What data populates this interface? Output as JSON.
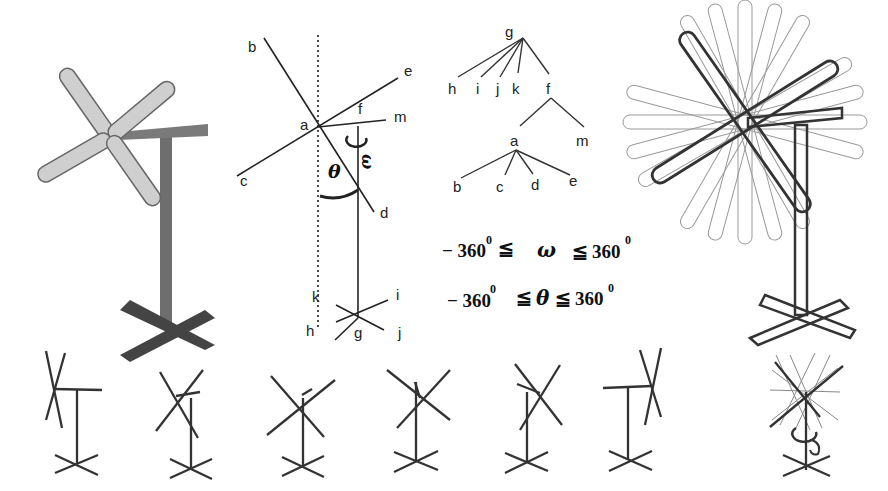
{
  "figure": {
    "panels": {
      "windmill_model": {
        "description": "Shaded windmill model with four blades, T-shaped post and X-shaped base"
      },
      "joint_diagram": {
        "labels": {
          "b": "b",
          "e": "e",
          "a": "a",
          "f": "f",
          "m": "m",
          "c": "c",
          "d": "d",
          "omega": "ω",
          "theta": "θ",
          "k": "k",
          "i": "i",
          "h": "h",
          "g": "g",
          "j": "j"
        }
      },
      "hierarchy_tree": {
        "root": "g",
        "level1": [
          "h",
          "i",
          "j",
          "k",
          "f"
        ],
        "f_children": [
          "a",
          "m"
        ],
        "a_children": [
          "b",
          "c",
          "d",
          "e"
        ]
      },
      "constraints": {
        "omega": {
          "min": "− 360",
          "sym": "ω",
          "max": "360",
          "rel1": "≦",
          "rel2": "≦",
          "deg": "0"
        },
        "theta": {
          "min": "− 360",
          "sym": "θ",
          "max": "360",
          "rel1": "≦",
          "rel2": "≦",
          "deg": "0"
        }
      },
      "rotation_overlay": {
        "description": "Windmill with superimposed blade positions showing full rotation range"
      },
      "pose_sequence": {
        "count": 6,
        "description": "Six stick-figure poses of the windmill rotating",
        "final": "Overlay of all poses with rotation arrow"
      }
    }
  }
}
